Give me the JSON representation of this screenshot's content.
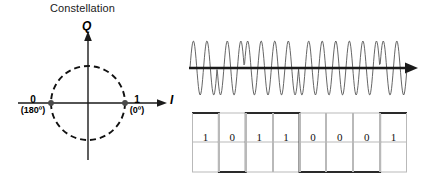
{
  "figure": {
    "background": "#ffffff",
    "stroke": "#000000"
  },
  "constellation": {
    "title": "Constellation",
    "q_axis_label": "Q",
    "i_axis_label": "I",
    "circle": {
      "cx": 88,
      "cy": 103,
      "r": 37,
      "style": "dashed"
    },
    "points": [
      {
        "name": "symbol-zero",
        "bit": "0",
        "phase": "(180º)",
        "x": 51,
        "y": 103
      },
      {
        "name": "symbol-one",
        "bit": "1",
        "phase": "(0º)",
        "x": 125,
        "y": 103
      }
    ]
  },
  "waveform": {
    "name": "bpsk-modulated-carrier",
    "color": "#555555",
    "axis_color": "#1a1a1a",
    "amplitude": 27,
    "baseline_y": 68,
    "x_start": 190,
    "x_end": 407,
    "cycles_per_bit": 2,
    "phase_by_bit_deg": {
      "1": 0,
      "0": 180
    }
  },
  "digital_signal": {
    "name": "baseband-bit-stream",
    "bits": [
      "1",
      "0",
      "1",
      "1",
      "0",
      "0",
      "0",
      "1"
    ],
    "levels": [
      1,
      0,
      1,
      1,
      0,
      0,
      0,
      1
    ],
    "grid_color": "#b9b9b9",
    "trace_color": "#2a2a2a",
    "x_start": 192,
    "x_end": 407,
    "top_y": 113,
    "bottom_y": 172,
    "mid_y": 142
  }
}
